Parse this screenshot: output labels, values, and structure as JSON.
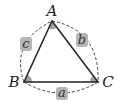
{
  "diagram": {
    "type": "triangle",
    "vertices": {
      "A": {
        "label": "A",
        "x": 52,
        "y": 21
      },
      "B": {
        "label": "B",
        "x": 24,
        "y": 82
      },
      "C": {
        "label": "C",
        "x": 98,
        "y": 82
      }
    },
    "sides": {
      "a": {
        "label": "a",
        "between": [
          "B",
          "C"
        ]
      },
      "b": {
        "label": "b",
        "between": [
          "A",
          "C"
        ]
      },
      "c": {
        "label": "c",
        "between": [
          "A",
          "B"
        ]
      }
    },
    "colors": {
      "line": "#222222",
      "dashed_arc": "#444444",
      "angle_fill": "#a0a0a0",
      "label_box": "#b5b5b5"
    }
  }
}
